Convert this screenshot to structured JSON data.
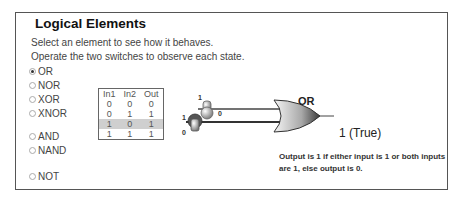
{
  "panel": {
    "title": "Logical Elements",
    "instructions": [
      "Select an element to see how it behaves.",
      "Operate the two switches to observe each state."
    ]
  },
  "elements": [
    {
      "label": "OR",
      "selected": true
    },
    {
      "label": "NOR",
      "selected": false
    },
    {
      "label": "XOR",
      "selected": false
    },
    {
      "label": "XNOR",
      "selected": false
    },
    {
      "label": "AND",
      "selected": false
    },
    {
      "label": "NAND",
      "selected": false
    },
    {
      "label": "NOT",
      "selected": false
    }
  ],
  "truth_table": {
    "headers": [
      "In1",
      "In2",
      "Out"
    ],
    "rows": [
      [
        "0",
        "0",
        "0"
      ],
      [
        "0",
        "1",
        "1"
      ],
      [
        "1",
        "0",
        "1"
      ],
      [
        "1",
        "1",
        "1"
      ]
    ],
    "highlighted_row": 2
  },
  "gate": {
    "name": "OR",
    "output_text": "1 (True)",
    "explanation": "Output is 1 if either input is 1 or both inputs are 1, else output is 0."
  },
  "switches": [
    {
      "name": "in1",
      "top_label": "1",
      "bottom_label": "0",
      "state": "0"
    },
    {
      "name": "in2",
      "top_label": "1",
      "bottom_label": "0",
      "state": "1"
    }
  ],
  "colors": {
    "highlight_row": "#cfcfcf",
    "border": "#555555"
  }
}
